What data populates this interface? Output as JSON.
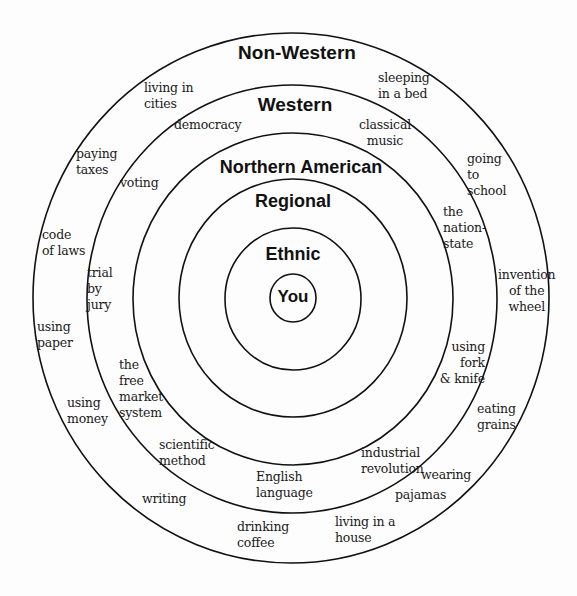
{
  "diagram": {
    "type": "concentric-circles",
    "center": {
      "x": 292,
      "y": 298
    },
    "stroke_color": "#111111",
    "rings": [
      {
        "name": "Non-Western",
        "rx": 258,
        "ry": 265
      },
      {
        "name": "Western",
        "rx": 205,
        "ry": 214
      },
      {
        "name": "Northern American",
        "rx": 160,
        "ry": 166
      },
      {
        "name": "Regional",
        "rx": 114,
        "ry": 119
      },
      {
        "name": "Ethnic",
        "rx": 68,
        "ry": 71
      },
      {
        "name": "You",
        "rx": 23,
        "ry": 24
      }
    ],
    "headings": {
      "non_western": "Non-Western",
      "western": "Western",
      "northern_american": "Northern American",
      "regional": "Regional",
      "ethnic": "Ethnic",
      "you": "You"
    },
    "non_western_items": {
      "living_in_cities": "living in\ncities",
      "sleeping_in_a_bed": "sleeping\nin a bed",
      "paying_taxes": "paying\ntaxes",
      "going_to_school": "going\nto\nschool",
      "code_of_laws": "code\nof laws",
      "invention_of_the_wheel": "invention\nof the\nwheel",
      "using_paper": "using\npaper",
      "using_money": "using\nmoney",
      "eating_grains": "eating\ngrains",
      "writing": "writing",
      "wearing_pajamas_1": "wearing",
      "wearing_pajamas_2": "pajamas",
      "drinking_coffee": "drinking\ncoffee",
      "living_in_a_house": "living in a\nhouse"
    },
    "western_items": {
      "democracy": "democracy",
      "classical_music": "classical\nmusic",
      "voting": "voting",
      "the_nation_state": "the\nnation-\nstate",
      "trial_by_jury": "trial\nby\njury",
      "using_fork_and_knife": "using\nfork\n& knife",
      "the_free_market_system": "the\nfree\nmarket\nsystem",
      "scientific_method": "scientific\nmethod",
      "industrial_revolution": "industrial\nrevolution",
      "english_language": "English\nlanguage"
    }
  }
}
